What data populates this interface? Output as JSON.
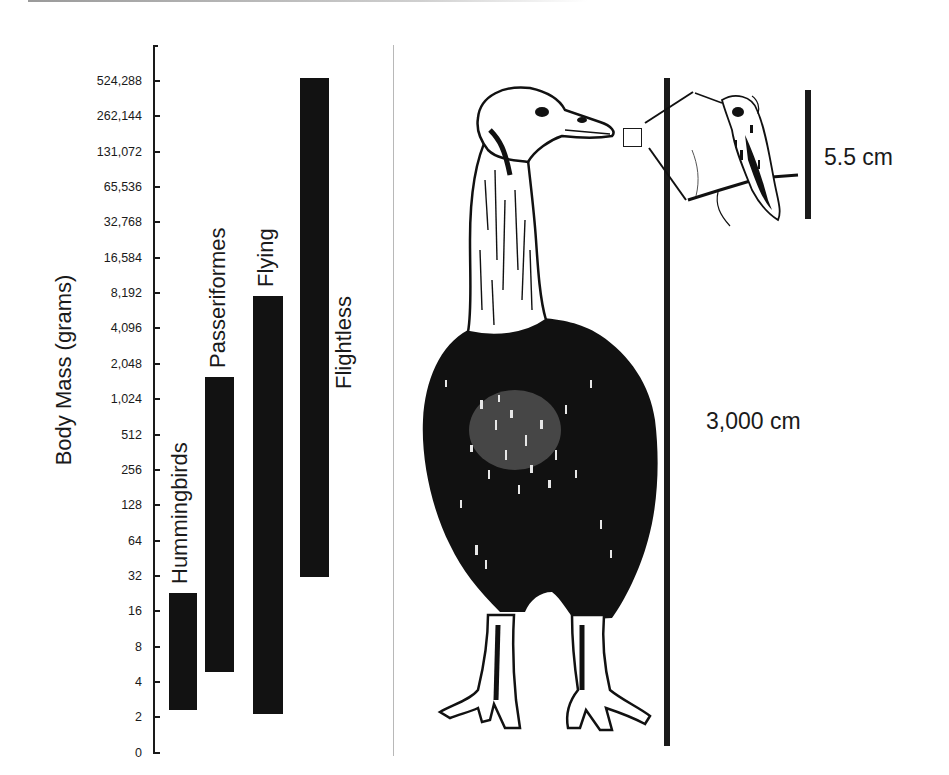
{
  "figure": {
    "left_panel": {
      "y_axis_label": "Body Mass (grams)",
      "tick_labels": [
        "524,288",
        "262,144",
        "131,072",
        "65,536",
        "32,768",
        "16,584",
        "8,192",
        "4,096",
        "2,048",
        "1,024",
        "512",
        "256",
        "128",
        "64",
        "32",
        "16",
        "8",
        "4",
        "2",
        "0"
      ],
      "bar_labels": [
        "Hummingbirds",
        "Passeriformes",
        "Flying",
        "Flightless"
      ]
    },
    "right_panel": {
      "large_scale_label": "3,000 cm",
      "small_scale_label": "5.5 cm",
      "large_bird": "flightless-giant-bird-illustration",
      "small_bird": "hummingbird-illustration"
    },
    "colors": {
      "bar": "#121212",
      "ink": "#1a1a1a",
      "divider": "#b8b8b8",
      "background": "#ffffff"
    }
  },
  "chart_data": {
    "type": "bar",
    "subtype": "floating-range-bar",
    "title": "",
    "xlabel": "",
    "ylabel": "Body Mass (grams)",
    "yscale": "log2",
    "y_ticks": [
      0,
      2,
      4,
      8,
      16,
      32,
      64,
      128,
      256,
      512,
      1024,
      2048,
      4096,
      8192,
      16584,
      32768,
      65536,
      131072,
      262144,
      524288
    ],
    "categories": [
      "Hummingbirds",
      "Passeriformes",
      "Flying",
      "Flightless"
    ],
    "series": [
      {
        "name": "min_mass_g",
        "values": [
          2.5,
          5,
          2.2,
          30
        ]
      },
      {
        "name": "max_mass_g",
        "values": [
          24,
          1500,
          7600,
          550000
        ]
      }
    ],
    "grid": false,
    "legend": "none (labels placed vertically beside bars)",
    "annotations": [
      "3,000 cm",
      "5.5 cm"
    ]
  }
}
